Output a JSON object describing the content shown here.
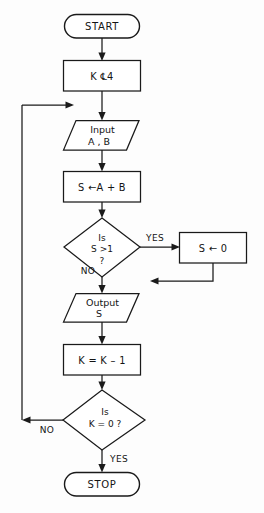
{
  "diagram": {
    "type": "flowchart",
    "background_color": "#fdfdfd",
    "line_color": "#1a1a1a",
    "shape_fill": "#ffffff",
    "nodes": [
      {
        "id": "start",
        "kind": "terminator",
        "label": "START"
      },
      {
        "id": "init_k",
        "kind": "process",
        "label": "K ℄4"
      },
      {
        "id": "input",
        "kind": "io",
        "line1": "Input",
        "line2": "A , B"
      },
      {
        "id": "sum",
        "kind": "process",
        "label": "S ←A + B"
      },
      {
        "id": "dec_s",
        "kind": "decision",
        "line1": "Is",
        "line2": "S >1",
        "line3": "?"
      },
      {
        "id": "reset_s",
        "kind": "process",
        "label": "S ← 0"
      },
      {
        "id": "output",
        "kind": "io",
        "line1": "Output",
        "line2": "S"
      },
      {
        "id": "dec_k_v",
        "kind": "process",
        "label": "K = K – 1"
      },
      {
        "id": "dec_k",
        "kind": "decision",
        "line1": "Is",
        "line2": "K = 0  ?"
      },
      {
        "id": "stop",
        "kind": "terminator",
        "label": "STOP"
      }
    ],
    "branch_labels": {
      "dec_s_yes": "YES",
      "dec_s_no": "NO",
      "dec_k_no": "NO",
      "dec_k_yes": "YES"
    }
  }
}
